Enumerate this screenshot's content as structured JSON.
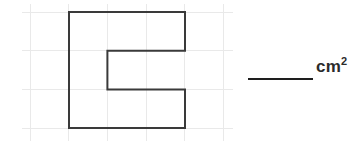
{
  "figure": {
    "background_color": "#ffffff",
    "grid": {
      "line_color": "#e9e9e9",
      "line_width": 1,
      "cell_size_px": 38.7,
      "x_lines": [
        30,
        68.7,
        107.4,
        146.1,
        184.8,
        223.5
      ],
      "y_lines": [
        12,
        50.7,
        89.4,
        128.1
      ],
      "x_extent": [
        22,
        233
      ],
      "y_extent": [
        4,
        141
      ]
    },
    "shape": {
      "name": "e-shape-polygon",
      "stroke_color": "#3a3a3a",
      "stroke_width": 2,
      "fill": "none",
      "points": "69,12 185,12 185,50.7 107.4,50.7 107.4,89.4 185,89.4 185,128.1 69,128.1",
      "outer_bounds": {
        "x1": 69,
        "y1": 12,
        "x2": 185,
        "y2": 128.1
      },
      "notch_bounds": {
        "x1": 107.4,
        "y1": 50.7,
        "x2": 185,
        "y2": 89.4
      },
      "grid_squares_wide": 3,
      "grid_squares_tall": 3,
      "notch_squares_wide": 2,
      "notch_squares_tall": 1
    },
    "answer_blank": {
      "name": "answer-line",
      "color": "#1e1e1e",
      "x1": 248,
      "x2": 313,
      "y": 79,
      "thickness": 2,
      "value": ""
    },
    "unit": {
      "text": "cm",
      "exponent": "2",
      "color": "#2b2b2b"
    }
  }
}
